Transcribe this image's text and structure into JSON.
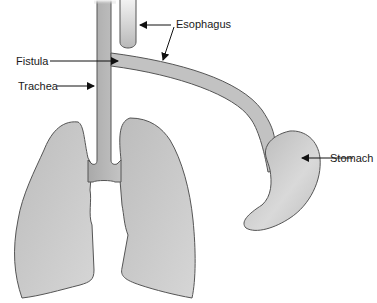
{
  "diagram": {
    "labels": {
      "esophagus": "Esophagus",
      "fistula": "Fistula",
      "trachea": "Trachea",
      "stomach": "Stomach"
    },
    "colors": {
      "organ_fill_light": "#d8d8d8",
      "organ_fill_dark": "#a8a8a8",
      "outline": "#555555",
      "text": "#1a1a1a",
      "background": "#ffffff"
    }
  }
}
